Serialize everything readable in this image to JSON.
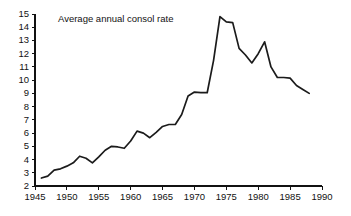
{
  "chart_data": {
    "type": "line",
    "title": "Average annual consol rate",
    "xlabel": "",
    "ylabel": "",
    "xlim": [
      1945,
      1990
    ],
    "ylim": [
      2,
      15
    ],
    "grid": false,
    "legend": null,
    "xticks": [
      1945,
      1950,
      1955,
      1960,
      1965,
      1970,
      1975,
      1980,
      1985,
      1990
    ],
    "yticks": [
      2,
      3,
      4,
      5,
      6,
      7,
      8,
      9,
      10,
      11,
      12,
      13,
      14,
      15
    ],
    "xtick_labels": [
      "1945",
      "1950",
      "1955",
      "1960",
      "1965",
      "1970",
      "1975",
      "1980",
      "1985",
      "1990"
    ],
    "ytick_labels": [
      "2",
      "3",
      "4",
      "5",
      "6",
      "7",
      "8",
      "9",
      "10",
      "11",
      "12",
      "13",
      "14",
      "15"
    ],
    "series": [
      {
        "name": "Average annual consol rate",
        "color": "#1b1b1b",
        "x": [
          1946,
          1947,
          1948,
          1949,
          1950,
          1951,
          1952,
          1953,
          1954,
          1955,
          1956,
          1957,
          1958,
          1959,
          1960,
          1961,
          1962,
          1963,
          1964,
          1965,
          1966,
          1967,
          1968,
          1969,
          1970,
          1971,
          1972,
          1973,
          1974,
          1975,
          1976,
          1977,
          1978,
          1979,
          1980,
          1981,
          1982,
          1983,
          1984,
          1985,
          1986,
          1987,
          1988
        ],
        "values": [
          2.6,
          2.75,
          3.2,
          3.3,
          3.5,
          3.75,
          4.25,
          4.1,
          3.75,
          4.2,
          4.7,
          5.0,
          4.95,
          4.85,
          5.4,
          6.15,
          6.0,
          5.65,
          6.05,
          6.5,
          6.65,
          6.65,
          7.4,
          8.8,
          9.1,
          9.05,
          9.05,
          11.5,
          14.8,
          14.4,
          14.35,
          12.4,
          11.9,
          11.3,
          12.0,
          12.9,
          11.0,
          10.2,
          10.2,
          10.15,
          9.6,
          9.3,
          9.0
        ]
      }
    ]
  },
  "axes": {
    "plot_left_px": 35,
    "plot_right_px": 322,
    "plot_top_px": 14,
    "plot_bottom_px": 186
  }
}
